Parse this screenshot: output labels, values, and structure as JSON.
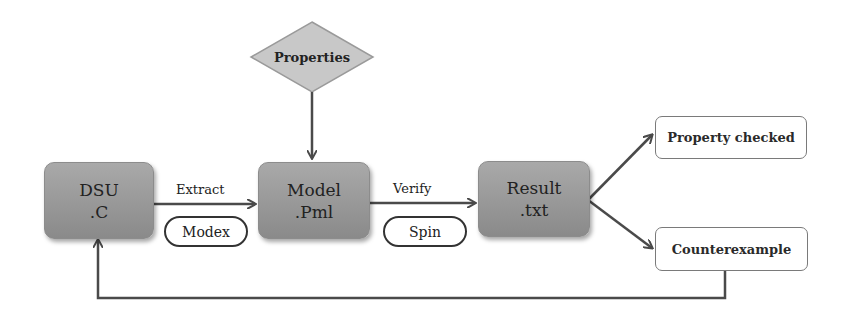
{
  "diagram": {
    "properties": {
      "label": "Properties"
    },
    "nodes": {
      "dsu": {
        "line1": "DSU",
        "line2": ".C"
      },
      "model": {
        "line1": "Model",
        "line2": ".Pml"
      },
      "result": {
        "line1": "Result",
        "line2": ".txt"
      }
    },
    "edges": {
      "extract": {
        "label": "Extract",
        "tool": "Modex"
      },
      "verify": {
        "label": "Verify",
        "tool": "Spin"
      }
    },
    "outcomes": {
      "property_checked": "Property checked",
      "counterexample": "Counterexample"
    },
    "colors": {
      "process_fill": "#9a9a9a",
      "diamond_fill": "#c8c8c8",
      "arrow": "#4a4a4a"
    }
  }
}
